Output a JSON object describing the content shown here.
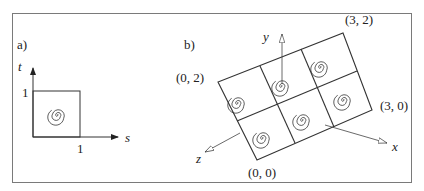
{
  "panel_a": {
    "label": "a)",
    "axis_t": "t",
    "axis_s": "s",
    "tick_t": "1",
    "tick_s": "1"
  },
  "panel_b": {
    "label": "b)",
    "axis_y": "y",
    "axis_x": "x",
    "axis_z": "z",
    "corner_02": "(0, 2)",
    "corner_32": "(3, 2)",
    "corner_30": "(3, 0)",
    "corner_00": "(0, 0)",
    "grid": {
      "columns": 3,
      "rows": 2
    }
  },
  "colors": {
    "line": "#333333",
    "frame": "#7a7a7a"
  }
}
